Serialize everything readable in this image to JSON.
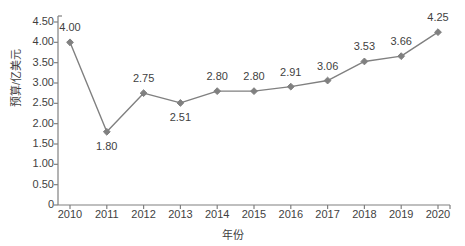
{
  "chart_data": {
    "type": "line",
    "title": "",
    "xlabel": "年份",
    "ylabel": "预算/亿美元",
    "categories": [
      "2010",
      "2011",
      "2012",
      "2013",
      "2014",
      "2015",
      "2016",
      "2017",
      "2018",
      "2019",
      "2020"
    ],
    "values": [
      4.0,
      1.8,
      2.75,
      2.51,
      2.8,
      2.8,
      2.91,
      3.06,
      3.53,
      3.66,
      4.25
    ],
    "point_labels": [
      "4.00",
      "1.80",
      "2.75",
      "2.51",
      "2.80",
      "2.80",
      "2.91",
      "3.06",
      "3.53",
      "3.66",
      "4.25"
    ],
    "label_positions": [
      "above",
      "below",
      "above",
      "below",
      "above",
      "above",
      "above",
      "above",
      "above",
      "above",
      "above"
    ],
    "ylim": [
      0,
      4.5
    ],
    "ytick_values": [
      0,
      0.5,
      1.0,
      1.5,
      2.0,
      2.5,
      3.0,
      3.5,
      4.0,
      4.5
    ],
    "ytick_labels": [
      "0",
      "0.50",
      "1.00",
      "1.50",
      "2.00",
      "2.50",
      "3.00",
      "3.50",
      "4.00",
      "4.50"
    ],
    "grid": false,
    "legend": null,
    "series_color": "#808080",
    "marker": "diamond",
    "axis_color": "#808080"
  }
}
